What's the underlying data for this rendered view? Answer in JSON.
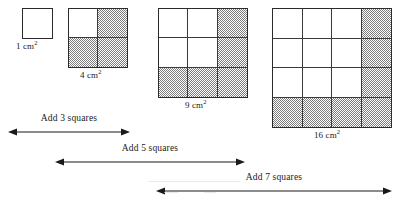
{
  "figure": {
    "type": "math-diagram",
    "topic": "Growing squares: consecutive perfect squares and odd-number differences",
    "background_color": "#ffffff",
    "ink_color": "#1a1a1a",
    "shade_color": "#7d7d7d"
  },
  "squares": [
    {
      "id": "square-1",
      "size": 1,
      "cells": 1,
      "area_label": "1 cm",
      "area_exponent": "2",
      "shaded_cells": 0,
      "shading": "none",
      "x": 22,
      "y": 8,
      "side": 31
    },
    {
      "id": "square-2",
      "size": 2,
      "cells": 4,
      "area_label": "4 cm",
      "area_exponent": "2",
      "shaded_cells": 3,
      "shading": "right-column-and-bottom-row",
      "x": 68,
      "y": 8,
      "side": 60
    },
    {
      "id": "square-3",
      "size": 3,
      "cells": 9,
      "area_label": "9 cm",
      "area_exponent": "2",
      "shaded_cells": 5,
      "shading": "right-column-and-bottom-row",
      "x": 158,
      "y": 8,
      "side": 90
    },
    {
      "id": "square-4",
      "size": 4,
      "cells": 16,
      "area_label": "16 cm",
      "area_exponent": "2",
      "shaded_cells": 7,
      "shading": "right-column-and-bottom-row",
      "x": 272,
      "y": 8,
      "side": 120
    }
  ],
  "arrows": [
    {
      "id": "arrow-add-3",
      "label": "Add 3 squares",
      "from_square": 1,
      "to_square": 4,
      "added_squares": 3,
      "x": 8,
      "y": 113,
      "width": 122
    },
    {
      "id": "arrow-add-5",
      "label": "Add 5 squares",
      "from_square": 4,
      "to_square": 9,
      "added_squares": 5,
      "x": 55,
      "y": 143,
      "width": 190
    },
    {
      "id": "arrow-add-7",
      "label": "Add 7 squares",
      "from_square": 9,
      "to_square": 16,
      "added_squares": 7,
      "x": 156,
      "y": 172,
      "width": 236
    }
  ],
  "chart_data": {
    "type": "table",
    "columns": [
      "Side (cm)",
      "Area (cm²)",
      "Squares added"
    ],
    "rows": [
      [
        "1",
        "1",
        ""
      ],
      [
        "2",
        "4",
        "3"
      ],
      [
        "3",
        "9",
        "5"
      ],
      [
        "4",
        "16",
        "7"
      ]
    ],
    "categories": [
      "1 cm²",
      "4 cm²",
      "9 cm²",
      "16 cm²"
    ],
    "values": [
      1,
      4,
      9,
      16
    ],
    "differences": [
      3,
      5,
      7
    ],
    "xlabel": "Side length",
    "ylabel": "Area"
  }
}
